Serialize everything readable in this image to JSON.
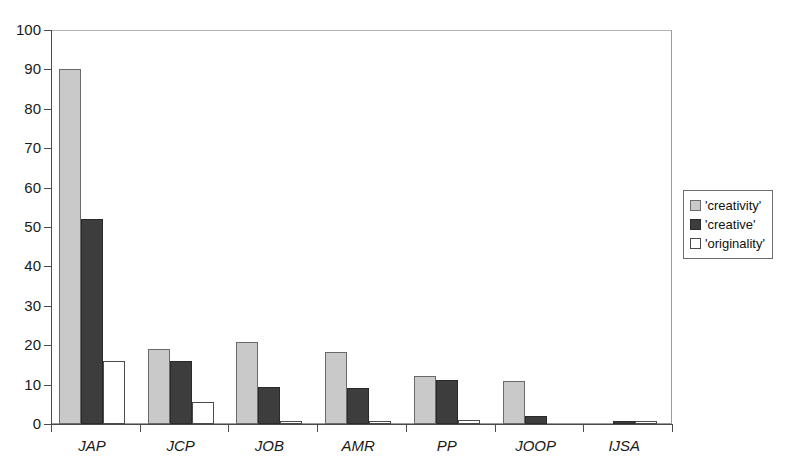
{
  "chart_data": {
    "type": "bar",
    "title": "",
    "xlabel": "",
    "ylabel": "",
    "ylim": [
      0,
      100
    ],
    "ytick_step": 10,
    "yticks": [
      0,
      10,
      20,
      30,
      40,
      50,
      60,
      70,
      80,
      90,
      100
    ],
    "grid": false,
    "legend_position": "right",
    "categories": [
      "JAP",
      "JCP",
      "JOB",
      "AMR",
      "PP",
      "JOOP",
      "IJSA"
    ],
    "series": [
      {
        "name": "'creativity'",
        "color": "#c9c9c9",
        "values": [
          90,
          19,
          20.7,
          18.4,
          12.2,
          11,
          0
        ]
      },
      {
        "name": "'creative'",
        "color": "#3d3d3d",
        "values": [
          52,
          15.9,
          9.5,
          9.2,
          11.1,
          2,
          0.5
        ]
      },
      {
        "name": "'originality'",
        "color": "#ffffff",
        "values": [
          16,
          5.7,
          0.6,
          0.5,
          1.1,
          0,
          0.5
        ]
      }
    ]
  },
  "legend": {
    "entries": [
      {
        "label": "'creativity'",
        "swatch": "creativity"
      },
      {
        "label": "'creative'",
        "swatch": "creative"
      },
      {
        "label": "'originality'",
        "swatch": "originality"
      }
    ]
  },
  "axes": {
    "y_labels": [
      "100",
      "90",
      "80",
      "70",
      "60",
      "50",
      "40",
      "30",
      "20",
      "10",
      "0"
    ],
    "x_labels": [
      "JAP",
      "JCP",
      "JOB",
      "AMR",
      "PP",
      "JOOP",
      "IJSA"
    ]
  },
  "colors": {
    "creativity": "#c9c9c9",
    "creative": "#3d3d3d",
    "originality": "#ffffff",
    "axis": "#4a4a4a",
    "frame": "#9a9a9a",
    "text": "#111111"
  }
}
